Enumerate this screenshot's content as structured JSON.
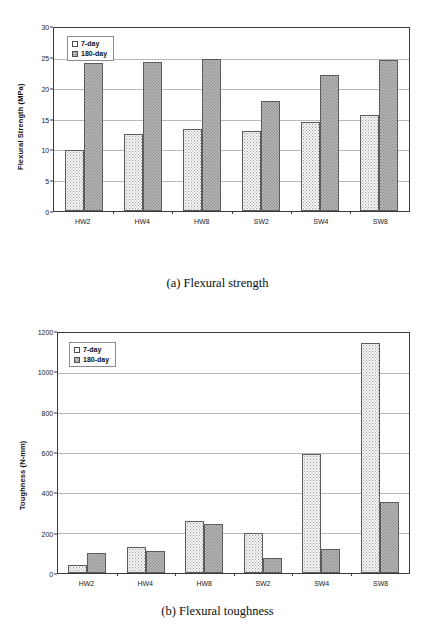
{
  "figures": [
    {
      "id": "a",
      "caption": "(a) Flexural strength",
      "legend": {
        "series": [
          "7-day",
          "180-day"
        ]
      },
      "chart_data": {
        "type": "bar",
        "title": "",
        "xlabel": "",
        "ylabel": "Flexural Strength (MPa)",
        "categories": [
          "HW2",
          "HW4",
          "HW8",
          "SW2",
          "SW4",
          "SW8"
        ],
        "series": [
          {
            "name": "7-day",
            "values": [
              10.0,
              12.7,
              13.4,
              13.1,
              14.6,
              15.8
            ]
          },
          {
            "name": "180-day",
            "values": [
              24.3,
              24.4,
              25.0,
              18.1,
              22.3,
              24.8
            ]
          }
        ],
        "ylim": [
          0,
          30
        ],
        "yticks": [
          0,
          5,
          10,
          15,
          20,
          25,
          30
        ],
        "ytick_labels": [
          "0",
          "5",
          "10",
          "15",
          "20",
          "25",
          "30"
        ],
        "grid": true,
        "legend_position": "top-left"
      }
    },
    {
      "id": "b",
      "caption": "(b) Flexural toughness",
      "legend": {
        "series": [
          "7-day",
          "180-day"
        ]
      },
      "chart_data": {
        "type": "bar",
        "title": "",
        "xlabel": "",
        "ylabel": "Toughness (N-mm)",
        "categories": [
          "HW2",
          "HW4",
          "HW8",
          "SW2",
          "SW4",
          "SW8"
        ],
        "series": [
          {
            "name": "7-day",
            "values": [
              40,
              130,
              258,
              198,
              595,
              1148
            ]
          },
          {
            "name": "180-day",
            "values": [
              100,
              112,
              245,
              75,
              120,
              355
            ]
          }
        ],
        "ylim": [
          0,
          1200
        ],
        "yticks": [
          0,
          200,
          400,
          600,
          800,
          1000,
          1200
        ],
        "ytick_labels": [
          "0",
          "200",
          "400",
          "600",
          "800",
          "1000",
          "1200"
        ],
        "grid": true,
        "legend_position": "top-left"
      }
    }
  ],
  "colors": {
    "series_7day": "#f7f7f5",
    "series_180day": "#b9b9b9",
    "axis": "#3a3a3a",
    "grid": "#b9b9b9",
    "text": "#1a1a1a"
  }
}
